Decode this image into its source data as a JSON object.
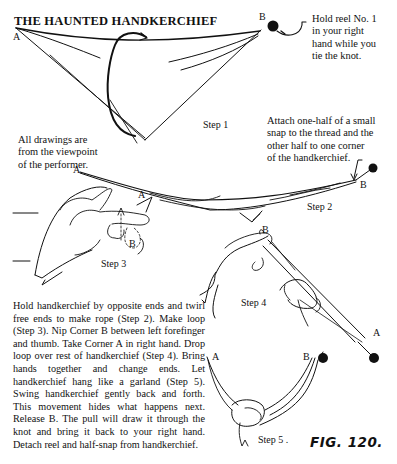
{
  "title": "THE HAUNTED HANDKERCHIEF",
  "figure_label": "FIG. 120.",
  "labels": {
    "corner_a": "A",
    "corner_b": "B"
  },
  "steps": {
    "step1": "Step 1",
    "step2": "Step 2",
    "step3": "Step 3",
    "step4": "Step 4",
    "step5": "Step 5 ."
  },
  "notes": {
    "reel": [
      "Hold reel No. 1",
      "in your right",
      "hand while you",
      "tie the knot."
    ],
    "viewpoint": [
      "All drawings are",
      "from the viewpoint",
      "of the performer."
    ],
    "snap": [
      "Attach one-half of a small",
      "snap to the thread and the",
      "other half to one corner",
      "of the handkerchief."
    ]
  },
  "instructions": "Hold handkerchief by opposite ends and twirl free ends to make rope (Step 2). Make loop (Step 3). Nip Corner B between left forefinger and thumb. Take Corner A in right hand. Drop loop over rest of handkerchief (Step 4). Bring hands together and change ends. Let handkerchief hang like a garland (Step 5). Swing handkerchief gently back and forth. This movement hides what happens next. Release B. The pull will draw it through the knot and bring it back to your right hand. Detach reel and half-snap from handkerchief.",
  "colors": {
    "ink": "#111111",
    "paper": "#ffffff"
  }
}
